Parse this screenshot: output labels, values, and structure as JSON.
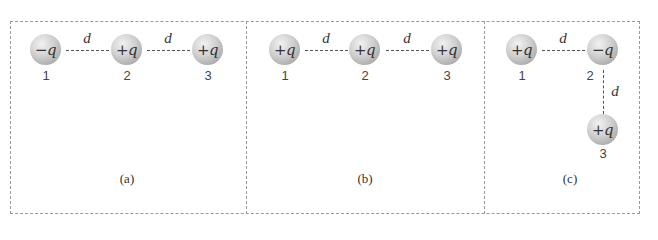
{
  "figure": {
    "panels": [
      {
        "caption": "(a)",
        "caption_letter": "a",
        "charges": [
          {
            "label": "−q",
            "index": "1"
          },
          {
            "label": "+q",
            "index": "2"
          },
          {
            "label": "+q",
            "index": "3"
          }
        ],
        "separations": [
          "d",
          "d"
        ]
      },
      {
        "caption": "(b)",
        "caption_letter": "b",
        "charges": [
          {
            "label": "+q",
            "index": "1"
          },
          {
            "label": "+q",
            "index": "2"
          },
          {
            "label": "+q",
            "index": "3"
          }
        ],
        "separations": [
          "d",
          "d"
        ]
      },
      {
        "caption": "(c)",
        "caption_letter": "c",
        "charges": [
          {
            "label": "+q",
            "index": "1"
          },
          {
            "label": "−q",
            "index": "2"
          },
          {
            "label": "+q",
            "index": "3"
          }
        ],
        "separations": [
          "d",
          "d"
        ]
      }
    ],
    "colors": {
      "border": "#9a9a9a",
      "ball_light": "#f2f2f2",
      "ball_dark": "#8e8e8e",
      "text": "#333333"
    }
  }
}
